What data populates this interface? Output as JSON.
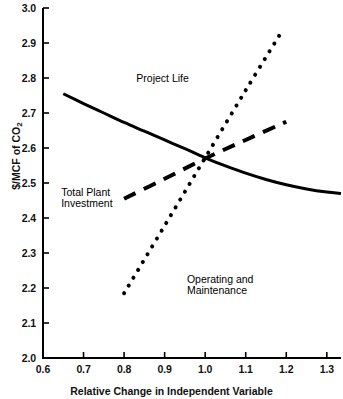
{
  "chart_data": {
    "type": "line",
    "title": "",
    "xlabel": "Relative Change in Independent Variable",
    "ylabel": "$/MCF of CO2",
    "ylabel_display": "$/MCF of CO",
    "ylabel_subscript": "2",
    "xlim": [
      0.6,
      1.335
    ],
    "ylim": [
      2.0,
      3.0
    ],
    "grid": false,
    "legend_position": "inline-annotations",
    "xticks": [
      "0.6",
      "0.7",
      "0.8",
      "0.9",
      "1.0",
      "1.1",
      "1.2",
      "1.3"
    ],
    "xtick_values": [
      0.6,
      0.7,
      0.8,
      0.9,
      1.0,
      1.1,
      1.2,
      1.3
    ],
    "yticks": [
      "2.0",
      "2.1",
      "2.2",
      "2.3",
      "2.4",
      "2.5",
      "2.6",
      "2.7",
      "2.8",
      "2.9",
      "3.0"
    ],
    "ytick_values": [
      2.0,
      2.1,
      2.2,
      2.3,
      2.4,
      2.5,
      2.6,
      2.7,
      2.8,
      2.9,
      3.0
    ],
    "series": [
      {
        "name": "Project Life",
        "style": "solid",
        "color": "#000000",
        "x": [
          0.65,
          0.7,
          0.75,
          0.8,
          0.85,
          0.9,
          0.95,
          1.0,
          1.05,
          1.1,
          1.15,
          1.2,
          1.25,
          1.3,
          1.335
        ],
        "values": [
          2.755,
          2.727,
          2.7,
          2.673,
          2.648,
          2.623,
          2.598,
          2.572,
          2.549,
          2.528,
          2.51,
          2.495,
          2.483,
          2.474,
          2.47
        ]
      },
      {
        "name": "Total Plant Investment",
        "style": "dashed",
        "color": "#000000",
        "x": [
          0.8,
          0.9,
          1.0,
          1.1,
          1.2
        ],
        "values": [
          2.455,
          2.512,
          2.57,
          2.623,
          2.675
        ]
      },
      {
        "name": "Operating and Maintenance",
        "style": "dotted",
        "color": "#000000",
        "x": [
          0.8,
          0.9,
          1.0,
          1.1,
          1.19
        ],
        "values": [
          2.185,
          2.378,
          2.572,
          2.765,
          2.935
        ]
      }
    ],
    "annotations": [
      {
        "text": "Project Life",
        "x": 0.83,
        "y": 2.8
      },
      {
        "text": "Total Plant",
        "x": 0.645,
        "y": 2.475
      },
      {
        "text": "Investment",
        "x": 0.645,
        "y": 2.443
      },
      {
        "text": "Operating and",
        "x": 0.955,
        "y": 2.225
      },
      {
        "text": "Maintenance",
        "x": 0.955,
        "y": 2.193
      }
    ]
  },
  "axis": {
    "x_title": "Relative Change in Independent Variable",
    "y_title_main": "$/MCF of CO",
    "y_title_sub": "2"
  },
  "labels": {
    "project_life": "Project Life",
    "total_plant_line1": "Total Plant",
    "total_plant_line2": "Investment",
    "o_and_m_line1": "Operating and",
    "o_and_m_line2": "Maintenance"
  }
}
